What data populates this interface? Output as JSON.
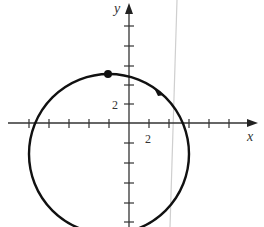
{
  "figure": {
    "type": "parametric-circle-graph",
    "axes": {
      "x_label": "x",
      "y_label": "y",
      "x_tick_label": "2",
      "y_tick_label": "2",
      "tick_spacing_units": 1,
      "x_range": [
        -12,
        12
      ],
      "y_range": [
        -10,
        12
      ]
    },
    "curve": {
      "shape": "circle",
      "center": [
        -2,
        -3
      ],
      "radius": 8,
      "direction": "clockwise",
      "start_point": [
        -2,
        5
      ],
      "color": "#111111"
    },
    "background_line": {
      "description": "faint grey vertical crease line",
      "color": "#c8c8c8"
    }
  }
}
